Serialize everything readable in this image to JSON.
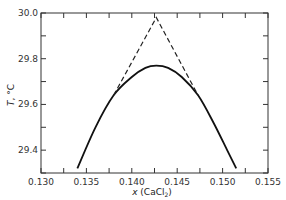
{
  "chart_data": {
    "type": "line",
    "title": "",
    "xlabel": "x (CaCl2)",
    "ylabel": "T, °C",
    "xlim": [
      0.13,
      0.155
    ],
    "ylim": [
      29.3,
      30.0
    ],
    "x_ticks": [
      "0.130",
      "0.135",
      "0.140",
      "0.145",
      "0.150",
      "0.155"
    ],
    "y_ticks": [
      "29.4",
      "29.6",
      "29.8",
      "30.0"
    ],
    "grid": false,
    "legend": null,
    "series": [
      {
        "name": "measured curve (solid)",
        "style": "solid",
        "x": [
          0.134,
          0.136,
          0.138,
          0.14,
          0.1415,
          0.1427,
          0.144,
          0.1455,
          0.1473,
          0.149,
          0.1505,
          0.1515
        ],
        "y": [
          29.32,
          29.5,
          29.64,
          29.72,
          29.76,
          29.77,
          29.76,
          29.72,
          29.64,
          29.52,
          29.4,
          29.32
        ]
      },
      {
        "name": "tangent extrapolation (dashed)",
        "style": "dashed",
        "x": [
          0.138,
          0.1427,
          0.1473
        ],
        "y": [
          29.64,
          29.98,
          29.64
        ]
      }
    ]
  }
}
